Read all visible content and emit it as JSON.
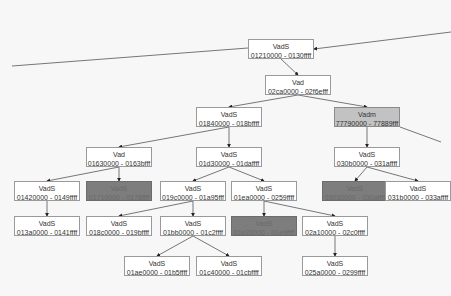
{
  "diagram": {
    "type": "tree",
    "nodes": [
      {
        "id": "n0",
        "tag": "VadS",
        "range": "01210000 - 0130ffff",
        "style": "normal"
      },
      {
        "id": "n1",
        "tag": "Vad",
        "range": "02ca0000 - 02f6efff",
        "style": "normal"
      },
      {
        "id": "n2",
        "tag": "VadS",
        "range": "01840000 - 018bffff",
        "style": "normal"
      },
      {
        "id": "n3",
        "tag": "Vadm",
        "range": "77790000 - 77889fff",
        "style": "mid"
      },
      {
        "id": "n4",
        "tag": "Vad",
        "range": "01630000 - 0163bfff",
        "style": "normal"
      },
      {
        "id": "n5",
        "tag": "VadS",
        "range": "01d30000 - 01daffff",
        "style": "normal"
      },
      {
        "id": "n6",
        "tag": "VadS",
        "range": "030b0000 - 031affff",
        "style": "normal"
      },
      {
        "id": "n7",
        "tag": "VadS",
        "range": "01420000 - 0149ffff",
        "style": "normal"
      },
      {
        "id": "n8",
        "tag": "VadS",
        "range": "01710000 - 0178ffff",
        "style": "dark"
      },
      {
        "id": "n9",
        "tag": "VadS",
        "range": "019c0000 - 01a95fff",
        "style": "normal"
      },
      {
        "id": "n10",
        "tag": "VadS",
        "range": "01ea0000 - 0259ffff",
        "style": "normal"
      },
      {
        "id": "n11",
        "tag": "VadS",
        "range": "03030000 - 030affff",
        "style": "dark"
      },
      {
        "id": "n12",
        "tag": "VadS",
        "range": "031b0000 - 033affff",
        "style": "normal"
      },
      {
        "id": "n13",
        "tag": "VadS",
        "range": "013a0000 - 0141ffff",
        "style": "normal"
      },
      {
        "id": "n14",
        "tag": "VadS",
        "range": "018c0000 - 019bffff",
        "style": "normal"
      },
      {
        "id": "n15",
        "tag": "VadS",
        "range": "01bb0000 - 01c2ffff",
        "style": "normal"
      },
      {
        "id": "n16",
        "tag": "VadS",
        "range": "01e20000 - 01e9ffff",
        "style": "dark"
      },
      {
        "id": "n17",
        "tag": "VadS",
        "range": "02a10000 - 02c0ffff",
        "style": "normal"
      },
      {
        "id": "n18",
        "tag": "VadS",
        "range": "01ae0000 - 01b5ffff",
        "style": "normal"
      },
      {
        "id": "n19",
        "tag": "VadS",
        "range": "01c40000 - 01cbffff",
        "style": "normal"
      },
      {
        "id": "n20",
        "tag": "VadS",
        "range": "025a0000 - 0299ffff",
        "style": "normal"
      }
    ],
    "edges": [
      [
        "ext-right",
        "n0"
      ],
      [
        "n0",
        "n1"
      ],
      [
        "n1",
        "n2"
      ],
      [
        "n1",
        "n3"
      ],
      [
        "n2",
        "n4"
      ],
      [
        "n2",
        "n5"
      ],
      [
        "n3",
        "n6"
      ],
      [
        "n3",
        "ext-right2"
      ],
      [
        "n4",
        "n7"
      ],
      [
        "n4",
        "n8"
      ],
      [
        "n5",
        "n9"
      ],
      [
        "n5",
        "n10"
      ],
      [
        "n6",
        "n11"
      ],
      [
        "n6",
        "n12"
      ],
      [
        "n7",
        "n13"
      ],
      [
        "n9",
        "n14"
      ],
      [
        "n9",
        "n15"
      ],
      [
        "n10",
        "n16"
      ],
      [
        "n10",
        "n17"
      ],
      [
        "n15",
        "n18"
      ],
      [
        "n15",
        "n19"
      ],
      [
        "n17",
        "n20"
      ]
    ],
    "colors": {
      "normal": "#ffffff",
      "mid": "#c2c2c2",
      "dark": "#7d7d7d",
      "edge": "#555555",
      "background": "#f7f7f7"
    }
  }
}
